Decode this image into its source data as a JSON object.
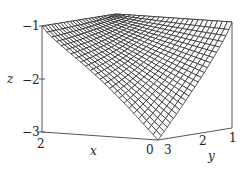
{
  "chart_data": {
    "type": "surface3d",
    "title": "",
    "xlabel": "x",
    "ylabel": "y",
    "zlabel": "z",
    "x_ticks": [
      "2",
      "0"
    ],
    "y_ticks": [
      "3",
      "2",
      "1"
    ],
    "z_ticks": [
      "-1",
      "-2",
      "-3"
    ],
    "xlim": [
      0,
      2
    ],
    "ylim": [
      1,
      3
    ],
    "zlim": [
      -3,
      -1
    ],
    "surface": {
      "description": "wireframe mesh; z = -1 along edges x=2 and y=1, dipping to z = -3 at corner (x=0, y=3)",
      "corner_values": [
        {
          "x": 2,
          "y": 3,
          "z": -1
        },
        {
          "x": 2,
          "y": 1,
          "z": -1
        },
        {
          "x": 0,
          "y": 1,
          "z": -1
        },
        {
          "x": 0,
          "y": 3,
          "z": -3
        }
      ],
      "grid_lines": 24
    },
    "box": true,
    "grid": false,
    "legend": null
  },
  "labels": {
    "z_axis": "z",
    "x_axis": "x",
    "y_axis": "y",
    "z_tick_top": "−1",
    "z_tick_mid": "−2",
    "z_tick_bot": "−3",
    "x_tick_left": "2",
    "x_tick_front": "0",
    "y_tick_front": "3",
    "y_tick_mid": "2",
    "y_tick_right": "1"
  },
  "colors": {
    "mesh_line": "#1a1a1a",
    "mesh_fill": "#ffffff",
    "box_line": "#555555"
  }
}
